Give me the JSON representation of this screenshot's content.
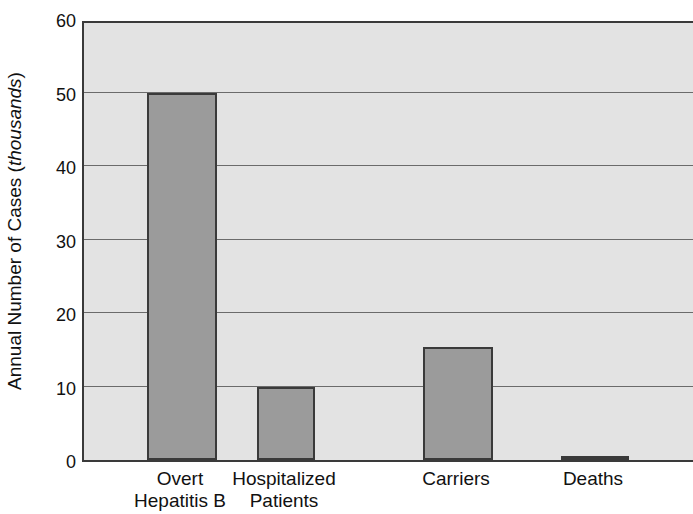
{
  "chart_data": {
    "type": "bar",
    "title": "",
    "subtitle": "",
    "xlabel": "",
    "ylabel_prefix": "Annual Number of Cases (",
    "ylabel_unit": "thousands",
    "ylabel_suffix": ")",
    "ylabel_full": "Annual Number of Cases (thousands)",
    "categories": [
      "Overt Hepatitis B",
      "Hospitalized Patients",
      "Carriers",
      "Deaths"
    ],
    "category_lines": [
      [
        "Overt",
        "Hepatitis B"
      ],
      [
        "Hospitalized",
        "Patients"
      ],
      [
        "Carriers",
        ""
      ],
      [
        "Deaths",
        ""
      ]
    ],
    "values": [
      50,
      10,
      15.4,
      0.5
    ],
    "ylim": [
      0,
      60
    ],
    "ytick_values": [
      0,
      10,
      20,
      30,
      40,
      50,
      60
    ],
    "ytick_labels": [
      "0",
      "10",
      "20",
      "30",
      "40",
      "50",
      "60"
    ],
    "grid": true,
    "grid_axis": "y",
    "legend": false,
    "legend_position": "none",
    "colors": {
      "bar_fill": "#9b9b9b",
      "bar_edge": "#3a3a3a",
      "plot_background": "#e3e3e3",
      "gridline": "#6b6b6b",
      "axis": "#3a3a3a",
      "text": "#111111",
      "figure_background": "#ffffff"
    }
  }
}
